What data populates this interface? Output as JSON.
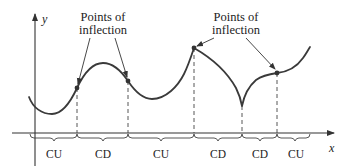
{
  "diagram": {
    "axes": {
      "x_label": "x",
      "y_label": "y"
    },
    "annotations": [
      {
        "line1": "Points of",
        "line2": "inflection"
      },
      {
        "line1": "Points of",
        "line2": "inflection"
      }
    ],
    "regions": [
      {
        "label": "CU"
      },
      {
        "label": "CD"
      },
      {
        "label": "CU"
      },
      {
        "label": "CD"
      },
      {
        "label": "CD"
      },
      {
        "label": "CU"
      }
    ],
    "colors": {
      "stroke": "#333333",
      "curve": "#3a3a3a",
      "background": "#ffffff"
    }
  }
}
